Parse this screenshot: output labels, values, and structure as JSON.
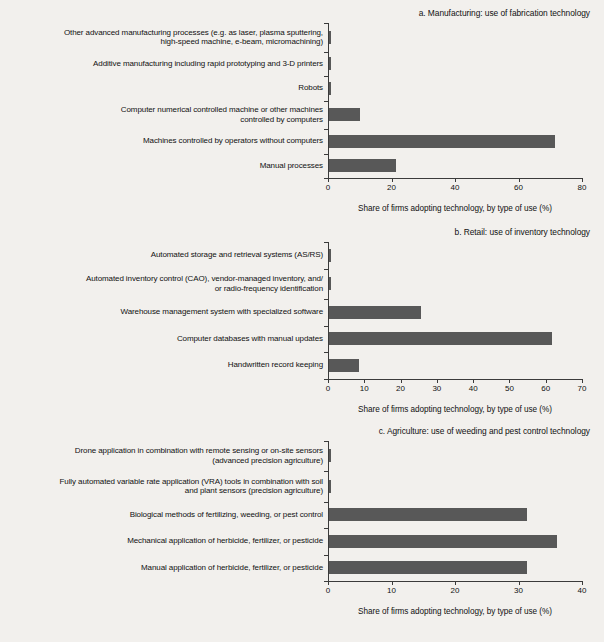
{
  "figure": {
    "background_color": "#f2f0ed",
    "bar_color": "#585858",
    "axis_color": "#3b3b3b",
    "shared_axis_title": "Share of firms adopting technology, by type of use (%)"
  },
  "chart_data": [
    {
      "type": "bar",
      "orientation": "horizontal",
      "title": "a. Manufacturing: use of fabrication technology",
      "xlabel": "Share of firms adopting technology, by type of use (%)",
      "ylabel": "",
      "xlim": [
        0,
        80
      ],
      "xticks": [
        0,
        20,
        40,
        60,
        80
      ],
      "grid": false,
      "legend": "none",
      "categories": [
        "Other advanced manufacturing processes (e.g. as laser, plasma sputtering, high-speed machine, e-beam, micromachining)",
        "Additive manufacturing including rapid prototyping and 3-D printers",
        "Robots",
        "Computer numerical controlled machine or other machines controlled by computers",
        "Machines controlled by operators without computers",
        "Manual processes"
      ],
      "values": [
        0.8,
        0.9,
        0.9,
        10,
        71.5,
        21.4
      ]
    },
    {
      "type": "bar",
      "orientation": "horizontal",
      "title": "b. Retail: use of inventory technology",
      "xlabel": "Share of firms adopting technology, by type of use (%)",
      "ylabel": "",
      "xlim": [
        0,
        70
      ],
      "xticks": [
        0,
        10,
        20,
        30,
        40,
        50,
        60,
        70
      ],
      "grid": false,
      "legend": "none",
      "categories": [
        "Automated storage and retrieval systems (AS/RS)",
        "Automated inventory control (CAO), vendor-managed inventory, and/ or radio-frequency identification",
        "Warehouse management system with specialized software",
        "Computer databases with manual updates",
        "Handwritten record keeping"
      ],
      "values": [
        0.7,
        0.8,
        25.7,
        61.7,
        8.6
      ]
    },
    {
      "type": "bar",
      "orientation": "horizontal",
      "title": "c. Agriculture: use of weeding and pest control technology",
      "xlabel": "Share of firms adopting technology, by type of use (%)",
      "ylabel": "",
      "xlim": [
        0,
        40
      ],
      "xticks": [
        0,
        10,
        20,
        30,
        40
      ],
      "grid": false,
      "legend": "none",
      "categories": [
        "Drone application in combination with remote sensing or on-site sensors (advanced precision agriculture)",
        "Fully automated variable rate application (VRA) tools in combination with soil and plant sensors (precision agriculture)",
        "Biological methods of fertilizing, weeding, or pest control",
        "Mechanical application of herbicide, fertilizer, or pesticide",
        "Manual application of herbicide, fertilizer, or pesticide"
      ],
      "values": [
        0.5,
        0.5,
        31.4,
        36.1,
        31.4
      ]
    }
  ],
  "panels": {
    "a": {
      "title": "a. Manufacturing: use of fabrication technology",
      "axis_title": "Share of firms adopting technology, by type of use (%)",
      "rows": [
        {
          "label_line1": "Other advanced manufacturing processes (e.g. as laser, plasma sputtering,",
          "label_line2": "high-speed machine, e-beam, micromachining)",
          "value": 0.8
        },
        {
          "label_line1": "Additive manufacturing including rapid prototyping and 3-D printers",
          "label_line2": "",
          "value": 0.9
        },
        {
          "label_line1": "Robots",
          "label_line2": "",
          "value": 0.9
        },
        {
          "label_line1": "Computer numerical controlled machine or other machines",
          "label_line2": "controlled by computers",
          "value": 10
        },
        {
          "label_line1": "Machines controlled by operators without computers",
          "label_line2": "",
          "value": 71.5
        },
        {
          "label_line1": "Manual processes",
          "label_line2": "",
          "value": 21.4
        }
      ],
      "ticks": [
        "0",
        "20",
        "40",
        "60",
        "80"
      ]
    },
    "b": {
      "title": "b. Retail: use of inventory technology",
      "axis_title": "Share of firms adopting technology, by type of use (%)",
      "rows": [
        {
          "label_line1": "Automated storage and retrieval systems (AS/RS)",
          "label_line2": "",
          "value": 0.7
        },
        {
          "label_line1": "Automated inventory control (CAO), vendor-managed inventory, and/",
          "label_line2": "or radio-frequency identification",
          "value": 0.8
        },
        {
          "label_line1": "Warehouse management system with specialized software",
          "label_line2": "",
          "value": 25.7
        },
        {
          "label_line1": "Computer databases with manual updates",
          "label_line2": "",
          "value": 61.7
        },
        {
          "label_line1": "Handwritten record keeping",
          "label_line2": "",
          "value": 8.6
        }
      ],
      "ticks": [
        "0",
        "10",
        "20",
        "30",
        "40",
        "50",
        "60",
        "70"
      ]
    },
    "c": {
      "title": "c. Agriculture: use of weeding and pest control technology",
      "axis_title": "Share of firms adopting technology, by type of use (%)",
      "rows": [
        {
          "label_line1": "Drone application in combination with remote sensing or on-site sensors",
          "label_line2": "(advanced precision agriculture)",
          "value": 0.5
        },
        {
          "label_line1": "Fully automated variable rate application (VRA) tools in combination with soil",
          "label_line2": "and plant sensors (precision agriculture)",
          "value": 0.5
        },
        {
          "label_line1": "Biological methods of fertilizing, weeding, or pest control",
          "label_line2": "",
          "value": 31.4
        },
        {
          "label_line1": "Mechanical application of herbicide, fertilizer, or pesticide",
          "label_line2": "",
          "value": 36.1
        },
        {
          "label_line1": "Manual application of herbicide, fertilizer, or pesticide",
          "label_line2": "",
          "value": 31.4
        }
      ],
      "ticks": [
        "0",
        "10",
        "20",
        "30",
        "40"
      ]
    }
  }
}
